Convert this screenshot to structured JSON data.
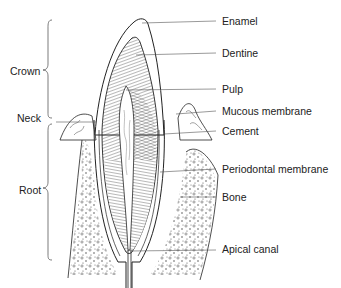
{
  "diagram": {
    "type": "anatomical cross-section of a tooth",
    "right_labels": [
      {
        "text": "Enamel",
        "x": 222,
        "y": 15
      },
      {
        "text": "Dentine",
        "x": 222,
        "y": 47
      },
      {
        "text": "Pulp",
        "x": 222,
        "y": 83
      },
      {
        "text": "Mucous membrane",
        "x": 222,
        "y": 105
      },
      {
        "text": "Cement",
        "x": 222,
        "y": 125
      },
      {
        "text": "Periodontal membrane",
        "x": 222,
        "y": 163
      },
      {
        "text": "Bone",
        "x": 222,
        "y": 191
      },
      {
        "text": "Apical canal",
        "x": 222,
        "y": 243
      }
    ],
    "left_labels": [
      {
        "text": "Crown",
        "x": 10,
        "y": 65
      },
      {
        "text": "Neck",
        "x": 17,
        "y": 112
      },
      {
        "text": "Root",
        "x": 19,
        "y": 184
      }
    ],
    "colors": {
      "ink": "#222222",
      "background": "#ffffff"
    }
  }
}
